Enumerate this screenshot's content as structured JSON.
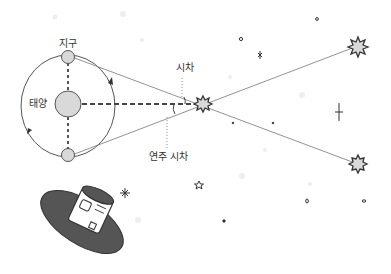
{
  "diagram": {
    "title": "",
    "type": "stellar parallax illustration",
    "labels": {
      "earth": "지구",
      "sun": "태양",
      "parallax": "시차",
      "annual_parallax": "연주 시차"
    },
    "nodes": [
      {
        "id": "sun",
        "label": "태양",
        "shape": "circle"
      },
      {
        "id": "earth_top",
        "label": "지구",
        "shape": "circle"
      },
      {
        "id": "earth_bottom",
        "label": "",
        "shape": "circle"
      },
      {
        "id": "near_star",
        "label": "",
        "shape": "starburst"
      },
      {
        "id": "far_star_top",
        "label": "",
        "shape": "starburst"
      },
      {
        "id": "far_star_bottom",
        "label": "",
        "shape": "starburst"
      },
      {
        "id": "telescope",
        "label": "",
        "shape": "space-telescope"
      }
    ],
    "edges": [
      {
        "from": "sun",
        "to": "near_star",
        "style": "dashed"
      },
      {
        "from": "sun",
        "to": "earth_top",
        "style": "dashed"
      },
      {
        "from": "sun",
        "to": "earth_bottom",
        "style": "dashed"
      },
      {
        "from": "earth_top",
        "to": "far_star_bottom",
        "style": "solid",
        "via": "near_star"
      },
      {
        "from": "earth_bottom",
        "to": "far_star_top",
        "style": "solid",
        "via": "near_star"
      }
    ],
    "annotations": [
      {
        "text": "시차",
        "points_to": "angle at near star"
      },
      {
        "text": "연주 시차",
        "points_to": "angle between sun line and earth line"
      }
    ],
    "colors": {
      "line": "#555555",
      "fill_body": "#d9d9d9",
      "telescope_dish": "#555555"
    }
  }
}
